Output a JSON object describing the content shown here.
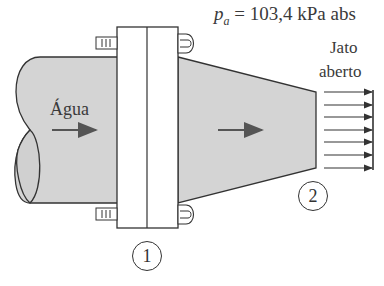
{
  "labels": {
    "pressure_symbol": "p",
    "pressure_subscript": "a",
    "pressure_value": " = 103,4 kPa abs",
    "fluid": "Água",
    "jet_line1": "Jato",
    "jet_line2": "aberto",
    "section_1": "1",
    "section_2": "2"
  },
  "colors": {
    "fill_gray": "#d4d4d4",
    "stroke": "#333333",
    "arrow": "#555555",
    "background": "#ffffff"
  },
  "icons": {
    "flow_arrow": "right-arrow",
    "jet_arrows_count": 7
  }
}
